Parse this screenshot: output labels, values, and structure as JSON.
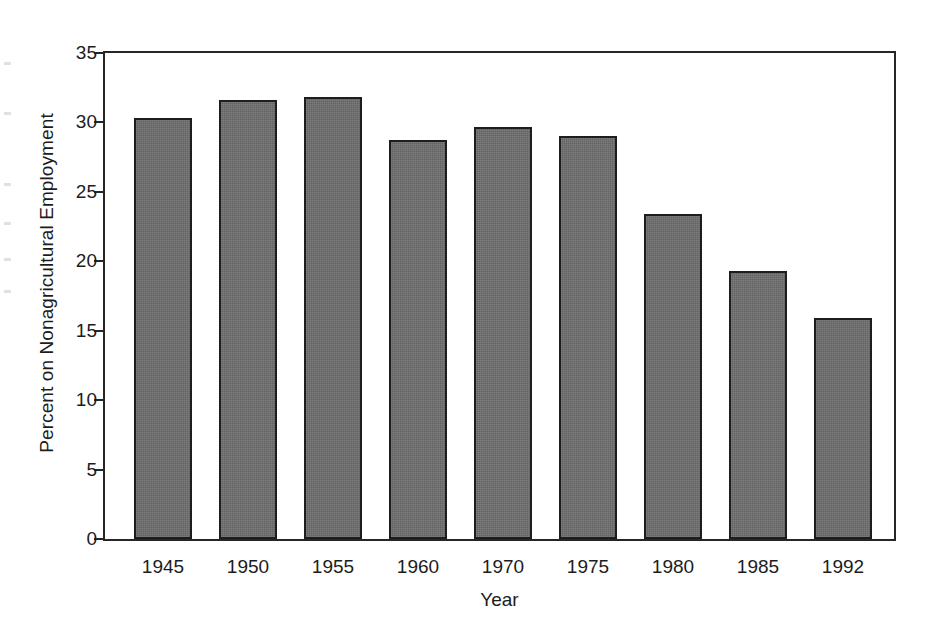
{
  "figure": {
    "name": "percent-on-nonagricultural-employment-bar-chart",
    "background_color": "#ffffff",
    "frame_color": "#262626",
    "bar_fill_color": "#6e6e6e",
    "bar_outline_color": "#1d1d1d",
    "text_color": "#1c1c1c"
  },
  "chart_data": {
    "type": "bar",
    "title": "",
    "subtitle": "",
    "xlabel": "Year",
    "ylabel": "Percent on Nonagricultural Employment",
    "categories": [
      "1945",
      "1950",
      "1955",
      "1960",
      "1970",
      "1975",
      "1980",
      "1985",
      "1992"
    ],
    "values": [
      30.3,
      31.6,
      31.8,
      28.7,
      29.7,
      29.0,
      23.4,
      19.3,
      15.9
    ],
    "ylim": [
      0,
      35
    ],
    "ytick_values": [
      0,
      5,
      10,
      15,
      20,
      25,
      30,
      35
    ],
    "ytick_labels": [
      "0",
      "5",
      "10",
      "15",
      "20",
      "25",
      "30",
      "35"
    ],
    "ytick_step": 5,
    "grid": false,
    "legend": false,
    "legend_position": "none",
    "annotations": []
  },
  "axes": {
    "y_title": "Percent on Nonagricultural Employment",
    "x_title": "Year"
  },
  "scan_artifacts": {
    "description": "faint ink bleed marks in left page margin",
    "marks": [
      {
        "top": 62
      },
      {
        "top": 112
      },
      {
        "top": 183
      },
      {
        "top": 222
      },
      {
        "top": 258
      },
      {
        "top": 290
      }
    ]
  }
}
